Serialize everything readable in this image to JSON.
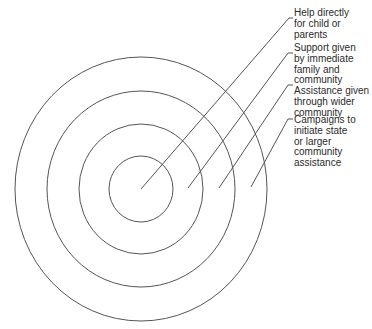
{
  "diagram": {
    "type": "concentric-circles",
    "stroke_color": "#555555",
    "text_color": "#2b2b2b",
    "center": {
      "x": 141,
      "y": 189
    },
    "rings": [
      {
        "name": "ring-inner",
        "rx": 32,
        "ry": 33
      },
      {
        "name": "ring-2",
        "rx": 62,
        "ry": 65
      },
      {
        "name": "ring-3",
        "rx": 94,
        "ry": 98
      },
      {
        "name": "ring-outer",
        "rx": 126,
        "ry": 132
      }
    ],
    "labels": [
      {
        "text": "Help directly\nfor child or\nparents",
        "top": 8,
        "line": {
          "x1": 141,
          "y1": 189,
          "x2": 289,
          "y2": 18,
          "tick_x": 293
        }
      },
      {
        "text": "Support given\nby immediate\nfamily and\ncommunity",
        "top": 43,
        "line": {
          "x1": 188,
          "y1": 188,
          "x2": 288,
          "y2": 53,
          "tick_x": 293
        }
      },
      {
        "text": "Assistance given\nthrough wider\ncommunity",
        "top": 86,
        "line": {
          "x1": 219,
          "y1": 188,
          "x2": 288,
          "y2": 85,
          "tick_x": 293
        }
      },
      {
        "text": "Campaigns to\ninitiate state\nor larger\ncommunity\nassistance",
        "top": 115,
        "line": {
          "x1": 251,
          "y1": 187,
          "x2": 288,
          "y2": 119,
          "tick_x": 293
        }
      }
    ]
  }
}
